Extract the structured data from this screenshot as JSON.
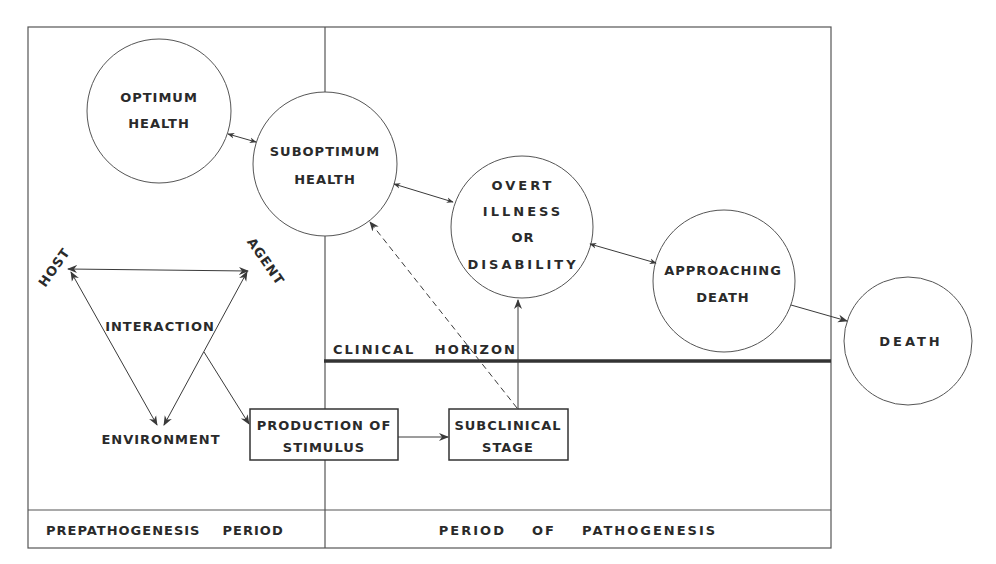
{
  "diagram": {
    "nodes": {
      "optimum_health": {
        "line1": "OPTIMUM",
        "line2": "HEALTH"
      },
      "suboptimum_health": {
        "line1": "SUBOPTIMUM",
        "line2": "HEALTH"
      },
      "overt_illness": {
        "line1": "OVERT",
        "line2": "ILLNESS",
        "line3": "OR",
        "line4": "DISABILITY"
      },
      "approaching_death": {
        "line1": "APPROACHING",
        "line2": "DEATH"
      },
      "death": {
        "label": "DEATH"
      },
      "production_of_stimulus": {
        "line1": "PRODUCTION OF",
        "line2": "STIMULUS"
      },
      "subclinical_stage": {
        "line1": "SUBCLINICAL",
        "line2": "STAGE"
      }
    },
    "triad": {
      "host": "HOST",
      "agent": "AGENT",
      "environment": "ENVIRONMENT",
      "interaction": "INTERACTION"
    },
    "clinical_horizon": "CLINICAL   HORIZON",
    "periods": {
      "prepathogenesis": "PREPATHOGENESIS    PERIOD",
      "pathogenesis": "PERIOD    OF    PATHOGENESIS"
    },
    "colors": {
      "line": "#3a3a3a",
      "text": "#2a2a2a",
      "background": "#ffffff"
    }
  }
}
